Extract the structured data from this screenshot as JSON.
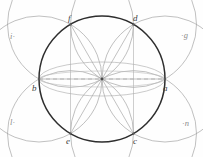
{
  "figure": {
    "background_color": "#fefefe",
    "main_circle_color": "#2e2e2e",
    "arc_color": "#9c9c9c",
    "chord_color": "#a8a8a8",
    "dashed_color": "#b0b0b0",
    "label_color": "#3b3b3b",
    "corner_label_color": "#8c8c8c",
    "center": {
      "x": 102,
      "y": 79
    },
    "radius": 63
  },
  "points": [
    {
      "id": "a",
      "label": "a",
      "angle_deg": 0,
      "x": 165,
      "y": 79
    },
    {
      "id": "b",
      "label": "b",
      "angle_deg": 180,
      "x": 39,
      "y": 79
    },
    {
      "id": "c",
      "label": "c",
      "angle_deg": 300,
      "x": 133.5,
      "y": 133.6
    },
    {
      "id": "d",
      "label": "d",
      "angle_deg": 60,
      "x": 133.5,
      "y": 24.4
    },
    {
      "id": "e",
      "label": "e",
      "angle_deg": 240,
      "x": 70.5,
      "y": 133.6
    },
    {
      "id": "f",
      "label": "f",
      "angle_deg": 120,
      "x": 70.5,
      "y": 24.4
    }
  ],
  "corner_labels": [
    {
      "id": "i",
      "label": "i",
      "marker": "·",
      "order": "label-then-dot",
      "position": "top-left"
    },
    {
      "id": "g",
      "label": "g",
      "marker": "·",
      "order": "dot-then-label",
      "position": "top-right"
    },
    {
      "id": "l",
      "label": "l",
      "marker": "·",
      "order": "label-then-dot",
      "position": "bottom-left"
    },
    {
      "id": "n",
      "label": "n",
      "marker": "·",
      "order": "dot-then-label",
      "position": "bottom-right"
    }
  ],
  "elements": {
    "main_circle": "main circle through all six points",
    "petal_arcs": "six arcs of equal radius centered at each hexagon vertex",
    "dashed_diameter": "dashed horizontal diameter from b to a",
    "chords": "radial chords from center to each vertex"
  }
}
